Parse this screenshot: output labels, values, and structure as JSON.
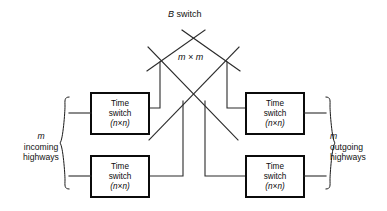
{
  "figure": {
    "title_italic_part": "B",
    "center_label": "m × m",
    "background_color": "#ffffff",
    "line_color": "#2b2b2b"
  },
  "switches": [
    {
      "id": "time-switch-top-left",
      "line1": "Time",
      "line2": "switch",
      "line3": "(n×n)",
      "position": "top-left"
    },
    {
      "id": "time-switch-bottom-left",
      "line1": "Time",
      "line2": "switch",
      "line3": "(n×n)",
      "position": "bottom-left"
    },
    {
      "id": "time-switch-top-right",
      "line1": "Time",
      "line2": "switch",
      "line3": "(n×n)",
      "position": "top-right"
    },
    {
      "id": "time-switch-bottom-right",
      "line1": "Time",
      "line2": "switch",
      "line3": "(n×n)",
      "position": "bottom-right"
    }
  ],
  "left_caption": {
    "symbol": "m",
    "line1": "incoming",
    "line2": "highways"
  },
  "right_caption": {
    "symbol": "m",
    "line1": "outgoing",
    "line2": "highways"
  }
}
